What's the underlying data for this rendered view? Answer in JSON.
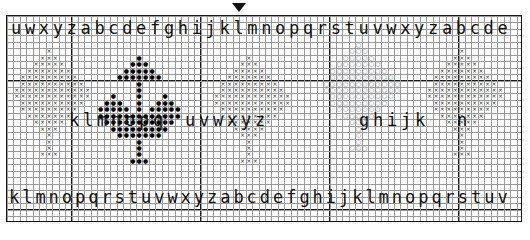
{
  "chart_data": {
    "type": "table",
    "grid": {
      "columns": 80,
      "rows": 32,
      "cell_size_px": 6.45,
      "bold_line_every": 10,
      "grid_on": true,
      "line_color": "#9a9a9a",
      "bold_line_color": "#1b1b1b"
    },
    "symbols": [
      {
        "key": "cross",
        "glyph": "×",
        "color": "#2a2a2a",
        "name": "cross-stitch-x"
      },
      {
        "key": "dot",
        "glyph": "●",
        "color": "#000000",
        "name": "cross-stitch-filled-dot"
      },
      {
        "key": "circle",
        "glyph": "○",
        "color": "#6d6d6d",
        "name": "cross-stitch-open-circle"
      }
    ],
    "motifs": [
      {
        "name": "butterfly-left",
        "symbol": "cross",
        "origin_col": 2,
        "origin_row": 5
      },
      {
        "name": "butterfly-center-left",
        "symbol": "dot",
        "origin_col": 14,
        "origin_row": 6
      },
      {
        "name": "butterfly-center-right",
        "symbol": "cross",
        "origin_col": 33,
        "origin_row": 6
      },
      {
        "name": "butterfly-right-circle",
        "symbol": "circle",
        "origin_col": 50,
        "origin_row": 4
      },
      {
        "name": "butterfly-far-right",
        "symbol": "cross",
        "origin_col": 66,
        "origin_row": 5
      }
    ]
  },
  "marker": {
    "name": "center-top-marker",
    "glyph": "▼"
  },
  "bands": {
    "top": {
      "label": "top-alphabet-row",
      "text": "uwxyzabcdefghijklmnopqrstuvwxyzabcde",
      "left_px": 10,
      "top_px": 22
    },
    "middle": {
      "label": "middle-alphabet-row",
      "text_left": "k l m n o p q",
      "text_right": "u v w x y z   g h i j k   n",
      "top_px": 112
    },
    "bottom": {
      "label": "bottom-alphabet-row",
      "text": "klmnopqrstuvwxyzabcdefghijklmnopqrstuv",
      "left_px": 8,
      "top_px": 190
    }
  },
  "letters_top": [
    "u",
    "w",
    "x",
    "y",
    "z",
    "a",
    "b",
    "c",
    "d",
    "e",
    "f",
    "g",
    "h",
    "i",
    "j",
    "k",
    "l",
    "m",
    "n",
    "o",
    "p",
    "q",
    "r",
    "s",
    "t",
    "u",
    "v",
    "w",
    "x",
    "y",
    "z",
    "a",
    "b",
    "c",
    "d",
    "e"
  ],
  "letters_bottom": [
    "k",
    "l",
    "m",
    "n",
    "o",
    "p",
    "q",
    "r",
    "s",
    "t",
    "u",
    "v",
    "w",
    "x",
    "y",
    "z",
    "a",
    "b",
    "c",
    "d",
    "e",
    "f",
    "g",
    "h",
    "i",
    "j",
    "k",
    "l",
    "m",
    "n",
    "o",
    "p",
    "q",
    "r",
    "s",
    "t",
    "u",
    "v"
  ],
  "letters_middle": [
    "k",
    "l",
    "m",
    "n",
    "o",
    "p",
    "q",
    "u",
    "v",
    "w",
    "x",
    "y",
    "z",
    "g",
    "h",
    "i",
    "j",
    "k",
    "n"
  ],
  "colors": {
    "background": "#ffffff",
    "frame": "#151515",
    "text": "#111111",
    "grid_fine": "#9a9a9a",
    "grid_bold": "#1b1b1b",
    "symbol_cross": "#2a2a2a",
    "symbol_dot": "#000000",
    "symbol_circle": "#6d6d6d"
  }
}
